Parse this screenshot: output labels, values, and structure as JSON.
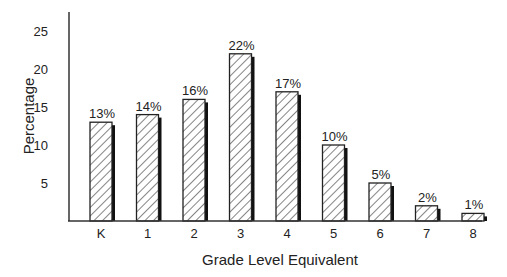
{
  "chart_data": {
    "type": "bar",
    "title": "",
    "xlabel": "Grade Level Equivalent",
    "ylabel": "Percentage",
    "categories": [
      "K",
      "1",
      "2",
      "3",
      "4",
      "5",
      "6",
      "7",
      "8"
    ],
    "values": [
      13,
      14,
      16,
      22,
      17,
      10,
      5,
      2,
      1
    ],
    "data_labels": [
      "13%",
      "14%",
      "16%",
      "22%",
      "17%",
      "10%",
      "5%",
      "2%",
      "1%"
    ],
    "yticks": [
      5,
      10,
      15,
      20,
      25
    ],
    "ylim": [
      0,
      27
    ],
    "grid": false,
    "legend": null,
    "bar_style": "hatched with drop shadow",
    "colors": {
      "bar_fill": "#ffffff",
      "hatch": "#333333",
      "shadow": "#111111",
      "axis": "#333333"
    }
  }
}
